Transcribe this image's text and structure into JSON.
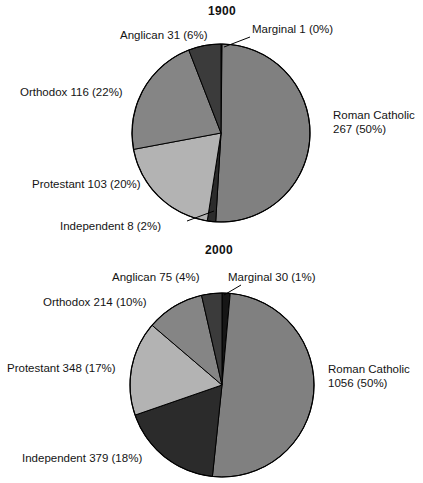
{
  "figure": {
    "width": 423,
    "height": 483,
    "background": "#ffffff"
  },
  "palette": {
    "roman_catholic": "#808080",
    "independent": "#2b2b2b",
    "protestant": "#b3b3b3",
    "orthodox": "#858585",
    "anglican": "#3b3b3b",
    "marginal": "#161616",
    "outline": "#000000",
    "text": "#141414"
  },
  "charts": [
    {
      "id": "pie-1900",
      "title": "1900",
      "title_x": 222,
      "title_y": 4,
      "center_x": 221,
      "center_y": 133,
      "radius": 89,
      "start_angle": -90,
      "slices": [
        {
          "key": "marginal",
          "name": "Marginal",
          "value": 1,
          "percent": 0,
          "label": "Marginal 1 (0%)",
          "color": "#161616",
          "label_x": 252,
          "label_y": 22,
          "align": "left",
          "lines": [
            "Marginal 1 (0%)"
          ],
          "leader": {
            "x1": 250,
            "y1": 37,
            "x2": 224,
            "y2": 47
          }
        },
        {
          "key": "roman_catholic",
          "name": "Roman Catholic",
          "value": 267,
          "percent": 50,
          "label": "Roman Catholic 267 (50%)",
          "color": "#808080",
          "label_x": 333,
          "label_y": 108,
          "align": "left",
          "lines": [
            "Roman Catholic",
            "267 (50%)"
          ],
          "leader": null
        },
        {
          "key": "independent",
          "name": "Independent",
          "value": 8,
          "percent": 2,
          "label": "Independent 8 (2%)",
          "color": "#2b2b2b",
          "label_x": 60,
          "label_y": 219,
          "align": "left",
          "lines": [
            "Independent 8 (2%)"
          ],
          "leader": {
            "x1": 187,
            "y1": 221,
            "x2": 214,
            "y2": 211
          }
        },
        {
          "key": "protestant",
          "name": "Protestant",
          "value": 103,
          "percent": 20,
          "label": "Protestant 103 (20%)",
          "color": "#b3b3b3",
          "label_x": 32,
          "label_y": 177,
          "align": "left",
          "lines": [
            "Protestant 103 (20%)"
          ],
          "leader": null
        },
        {
          "key": "orthodox",
          "name": "Orthodox",
          "value": 116,
          "percent": 22,
          "label": "Orthodox 116 (22%)",
          "color": "#858585",
          "label_x": 20,
          "label_y": 85,
          "align": "left",
          "lines": [
            "Orthodox 116 (22%)"
          ],
          "leader": null
        },
        {
          "key": "anglican",
          "name": "Anglican",
          "value": 31,
          "percent": 6,
          "label": "Anglican 31 (6%)",
          "color": "#3b3b3b",
          "label_x": 120,
          "label_y": 28,
          "align": "left",
          "lines": [
            "Anglican 31 (6%)"
          ],
          "leader": null
        }
      ]
    },
    {
      "id": "pie-2000",
      "title": "2000",
      "title_x": 219,
      "title_y": 243,
      "center_x": 222,
      "center_y": 385,
      "radius": 92,
      "start_angle": -90,
      "slices": [
        {
          "key": "marginal",
          "name": "Marginal",
          "value": 30,
          "percent": 1,
          "label": "Marginal 30 (1%)",
          "color": "#161616",
          "label_x": 228,
          "label_y": 270,
          "align": "left",
          "lines": [
            "Marginal 30 (1%)"
          ],
          "leader": {
            "x1": 241,
            "y1": 285,
            "x2": 224,
            "y2": 295
          }
        },
        {
          "key": "roman_catholic",
          "name": "Roman Catholic",
          "value": 1056,
          "percent": 50,
          "label": "Roman Catholic 1056 (50%)",
          "color": "#808080",
          "label_x": 328,
          "label_y": 362,
          "align": "left",
          "lines": [
            "Roman Catholic",
            "1056 (50%)"
          ],
          "leader": null
        },
        {
          "key": "independent",
          "name": "Independent",
          "value": 379,
          "percent": 18,
          "label": "Independent 379 (18%)",
          "color": "#2b2b2b",
          "label_x": 22,
          "label_y": 451,
          "align": "left",
          "lines": [
            "Independent 379 (18%)"
          ],
          "leader": null
        },
        {
          "key": "protestant",
          "name": "Protestant",
          "value": 348,
          "percent": 17,
          "label": "Protestant 348 (17%)",
          "color": "#b3b3b3",
          "label_x": 7,
          "label_y": 361,
          "align": "left",
          "lines": [
            "Protestant 348 (17%)"
          ],
          "leader": null
        },
        {
          "key": "orthodox",
          "name": "Orthodox",
          "value": 214,
          "percent": 10,
          "label": "Orthodox 214 (10%)",
          "color": "#858585",
          "label_x": 43,
          "label_y": 295,
          "align": "left",
          "lines": [
            "Orthodox 214 (10%)"
          ],
          "leader": null
        },
        {
          "key": "anglican",
          "name": "Anglican",
          "value": 75,
          "percent": 4,
          "label": "Anglican 75 (4%)",
          "color": "#3b3b3b",
          "label_x": 112,
          "label_y": 270,
          "align": "left",
          "lines": [
            "Anglican 75 (4%)"
          ],
          "leader": null
        }
      ]
    }
  ],
  "chart_data": [
    {
      "type": "pie",
      "title": "1900",
      "xlabel": "",
      "ylabel": "",
      "categories": [
        "Marginal",
        "Roman Catholic",
        "Independent",
        "Protestant",
        "Orthodox",
        "Anglican"
      ],
      "values": [
        1,
        267,
        8,
        103,
        116,
        31
      ],
      "percents": [
        0,
        50,
        2,
        20,
        22,
        6
      ],
      "labels": [
        "Marginal 1 (0%)",
        "Roman Catholic 267 (50%)",
        "Independent 8 (2%)",
        "Protestant 103 (20%)",
        "Orthodox 116 (22%)",
        "Anglican 31 (6%)"
      ],
      "units": "millions of adherents",
      "legend": "none",
      "grid": false,
      "start_angle_deg": -90,
      "direction": "clockwise"
    },
    {
      "type": "pie",
      "title": "2000",
      "xlabel": "",
      "ylabel": "",
      "categories": [
        "Marginal",
        "Roman Catholic",
        "Independent",
        "Protestant",
        "Orthodox",
        "Anglican"
      ],
      "values": [
        30,
        1056,
        379,
        348,
        214,
        75
      ],
      "percents": [
        1,
        50,
        18,
        17,
        10,
        4
      ],
      "labels": [
        "Marginal 30 (1%)",
        "Roman Catholic 1056 (50%)",
        "Independent 379 (18%)",
        "Protestant 348 (17%)",
        "Orthodox 214 (10%)",
        "Anglican 75 (4%)"
      ],
      "units": "millions of adherents",
      "legend": "none",
      "grid": false,
      "start_angle_deg": -90,
      "direction": "clockwise"
    }
  ]
}
